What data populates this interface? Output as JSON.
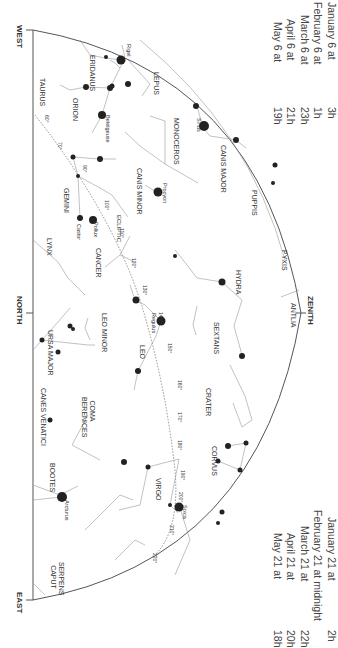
{
  "horizon_labels": {
    "west": "WEST",
    "north": "NORTH",
    "east": "EAST",
    "zenith": "ZENITH"
  },
  "viewing_times_top": [
    {
      "date": "January 6 at",
      "time": "3h"
    },
    {
      "date": "February 6 at",
      "time": "1h"
    },
    {
      "date": "March 6 at",
      "time": "23h"
    },
    {
      "date": "April 6 at",
      "time": "21h"
    },
    {
      "date": "May 6 at",
      "time": "19h"
    }
  ],
  "viewing_times_bottom": [
    {
      "date": "January 21 at",
      "time": "2h"
    },
    {
      "date": "February 21 at midnight",
      "time": ""
    },
    {
      "date": "March 21 at",
      "time": "22h"
    },
    {
      "date": "April 21 at",
      "time": "20h"
    },
    {
      "date": "May 21 at",
      "time": "18h"
    }
  ],
  "constellations": [
    {
      "name": "ERIDANUS"
    },
    {
      "name": "TAURUS"
    },
    {
      "name": "ORION"
    },
    {
      "name": "LEPUS"
    },
    {
      "name": "MONOCEROS"
    },
    {
      "name": "CANIS MAJOR"
    },
    {
      "name": "CANIS MINOR"
    },
    {
      "name": "GEMINI"
    },
    {
      "name": "PUPPIS"
    },
    {
      "name": "LYNX"
    },
    {
      "name": "CANCER"
    },
    {
      "name": "PYXIS"
    },
    {
      "name": "HYDRA"
    },
    {
      "name": "ANTLIA"
    },
    {
      "name": "URSA MAJOR"
    },
    {
      "name": "LEO MINOR"
    },
    {
      "name": "SEXTANS"
    },
    {
      "name": "LEO"
    },
    {
      "name": "CRATER"
    },
    {
      "name": "COMA BERENICES"
    },
    {
      "name": "CANES VENATICI"
    },
    {
      "name": "CORVUS"
    },
    {
      "name": "VIRGO"
    },
    {
      "name": "BOOTES"
    },
    {
      "name": "SERPENS CAPUT"
    }
  ],
  "stars": [
    {
      "name": "Rigel"
    },
    {
      "name": "Betelgeuse"
    },
    {
      "name": "Sirius"
    },
    {
      "name": "Procyon"
    },
    {
      "name": "Castor"
    },
    {
      "name": "Pollux"
    },
    {
      "name": "Regulus"
    },
    {
      "name": "Spica"
    },
    {
      "name": "Arcturus"
    }
  ],
  "ecliptic": {
    "label": "ECLIPTIC",
    "degree_marks": [
      "60°",
      "70°",
      "90°",
      "100°",
      "110°",
      "120°",
      "130°",
      "140°",
      "150°",
      "160°",
      "170°",
      "180°",
      "190°",
      "200°",
      "210°",
      "220°"
    ]
  }
}
